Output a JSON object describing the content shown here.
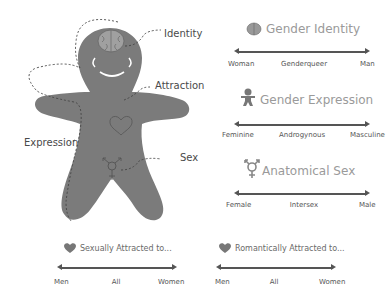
{
  "figure": {
    "name": "Gingerbread Person",
    "callouts": {
      "identity": "Identity",
      "attraction": "Attraction",
      "expression": "Expression",
      "sex": "Sex"
    },
    "colors": {
      "body": "#7b7b7b",
      "outline": "#555555"
    }
  },
  "spectrums": [
    {
      "id": "gender-identity",
      "icon": "brain-icon",
      "title": "Gender Identity",
      "labels": [
        "Woman",
        "Genderqueer",
        "Man"
      ]
    },
    {
      "id": "gender-expression",
      "icon": "gingerbread-icon",
      "title": "Gender Expression",
      "labels": [
        "Feminine",
        "Androgynous",
        "Masculine"
      ]
    },
    {
      "id": "anatomical-sex",
      "icon": "transgender-symbol-icon",
      "title": "Anatomical Sex",
      "labels": [
        "Female",
        "Intersex",
        "Male"
      ]
    },
    {
      "id": "sexually-attracted",
      "icon": "heart-icon",
      "title": "Sexually Attracted to...",
      "labels": [
        "Men",
        "All",
        "Women"
      ]
    },
    {
      "id": "romantically-attracted",
      "icon": "heart-icon",
      "title": "Romantically Attracted to...",
      "labels": [
        "Men",
        "All",
        "Women"
      ]
    }
  ]
}
